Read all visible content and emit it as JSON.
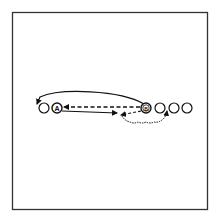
{
  "diagram": {
    "type": "drill-diagram",
    "border": {
      "x": 12,
      "y": 12,
      "width": 195,
      "height": 197
    },
    "stroke_color": "#111111",
    "background": "#ffffff",
    "players": [
      {
        "id": "p1",
        "label": "",
        "x": 44,
        "y": 108,
        "type": "open"
      },
      {
        "id": "A",
        "label": "A",
        "x": 57,
        "y": 108,
        "type": "lettered"
      },
      {
        "id": "B",
        "label": "B",
        "x": 146,
        "y": 108,
        "type": "lettered-double"
      },
      {
        "id": "p2",
        "label": "",
        "x": 160,
        "y": 108,
        "type": "open"
      },
      {
        "id": "p3",
        "label": "",
        "x": 174,
        "y": 108,
        "type": "open"
      },
      {
        "id": "p4",
        "label": "",
        "x": 187,
        "y": 108,
        "type": "open"
      }
    ],
    "paths": [
      {
        "id": "pass-b-to-a",
        "style": "dashed",
        "from": "B",
        "to": "A",
        "description": "dashed pass from B back to A"
      },
      {
        "id": "pass-a-forward",
        "style": "solid",
        "from": "A",
        "to": "point",
        "description": "solid arrow from A to mid-point near B"
      },
      {
        "id": "run-b-over",
        "style": "solid-curve",
        "from": "B",
        "to": "left-end",
        "description": "curved run from B arching over to the far left"
      },
      {
        "id": "dash-b-down",
        "style": "dashed",
        "from": "B",
        "to": "point",
        "description": "short dashed arrow from B down-left"
      },
      {
        "id": "dribble-loop",
        "style": "wavy",
        "from": "point",
        "to": "p3",
        "description": "wavy dribble path curving under to the next player"
      }
    ]
  }
}
